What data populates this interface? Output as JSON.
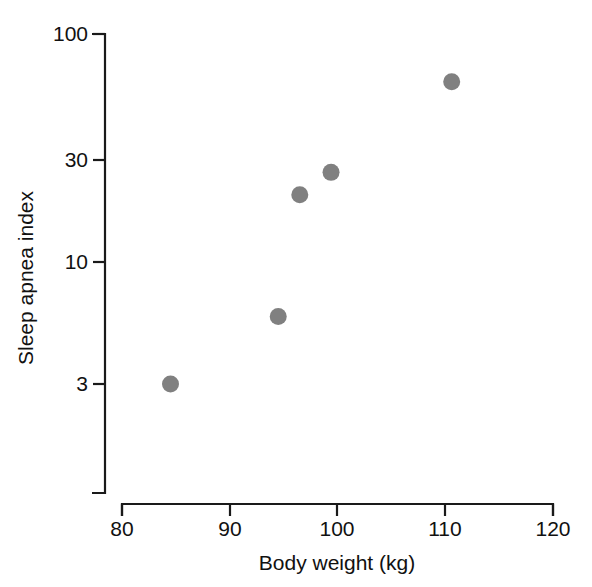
{
  "chart_data": {
    "type": "scatter",
    "title": "",
    "subtitle": "",
    "xlabel": "Body weight (kg)",
    "ylabel": "Sleep apnea index",
    "x": [
      84.5,
      94.5,
      96.5,
      99.4,
      110.6
    ],
    "y": [
      3.0,
      5.9,
      20.0,
      25.0,
      62.0
    ],
    "series": [
      {
        "name": "Subjects",
        "points": [
          {
            "x": 84.5,
            "y": 3.0
          },
          {
            "x": 94.5,
            "y": 5.9
          },
          {
            "x": 96.5,
            "y": 20.0
          },
          {
            "x": 99.4,
            "y": 25.0
          },
          {
            "x": 110.6,
            "y": 62.0
          }
        ]
      }
    ],
    "xscale": "linear",
    "yscale": "log",
    "xlim": [
      80,
      120
    ],
    "ylim": [
      2.0,
      100
    ],
    "xticks": [
      80,
      90,
      100,
      110,
      120
    ],
    "xticklabels": [
      "80",
      "90",
      "100",
      "110",
      "120"
    ],
    "yticks": [
      3,
      10,
      30,
      100
    ],
    "yticklabels": [
      "3",
      "10",
      "30",
      "100"
    ],
    "grid": false,
    "legend": "none",
    "marker_color": "#808080",
    "axis_color": "#1a1a1a",
    "background_color": "#ffffff",
    "marker_radius_px": 8.5
  },
  "axes": {
    "y_axis_label": "Sleep apnea index",
    "x_axis_label": "Body weight (kg)",
    "y_tick_labels": [
      "100",
      "30",
      "10",
      "3"
    ],
    "x_tick_labels": [
      "80",
      "90",
      "100",
      "110",
      "120"
    ]
  }
}
